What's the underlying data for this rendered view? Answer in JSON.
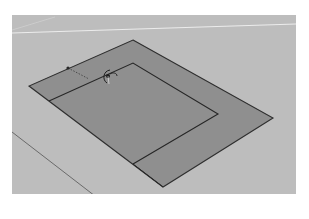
{
  "header": {
    "caption": ""
  },
  "viewport": {
    "background_color": "#bdbdbd",
    "ground_line_color": "#e8e8e8",
    "axis_line_color": "#6a6a6a",
    "face_color": "#8f8f8f",
    "edge_color": "#2e2e2e",
    "tool": "offset-tool",
    "inference_line": "dotted"
  },
  "footer": {
    "caption": ""
  }
}
